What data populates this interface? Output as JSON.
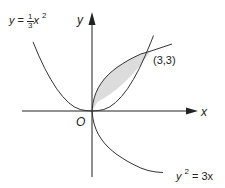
{
  "diagram": {
    "title": "",
    "axes": {
      "x_label": "x",
      "y_label": "y",
      "origin_label": "O"
    },
    "curves": [
      {
        "name": "parabola-up",
        "equation_lhs": "y",
        "equation_eq": "=",
        "coef_num": "1",
        "coef_den": "3",
        "var": "x",
        "power": "2"
      },
      {
        "name": "parabola-right",
        "lhs_var": "y",
        "lhs_power": "2",
        "equation_eq": "= 3x"
      }
    ],
    "intersection_label": "(3,3)",
    "colors": {
      "line": "#222222",
      "shaded_region": "#dcdcdc"
    }
  }
}
